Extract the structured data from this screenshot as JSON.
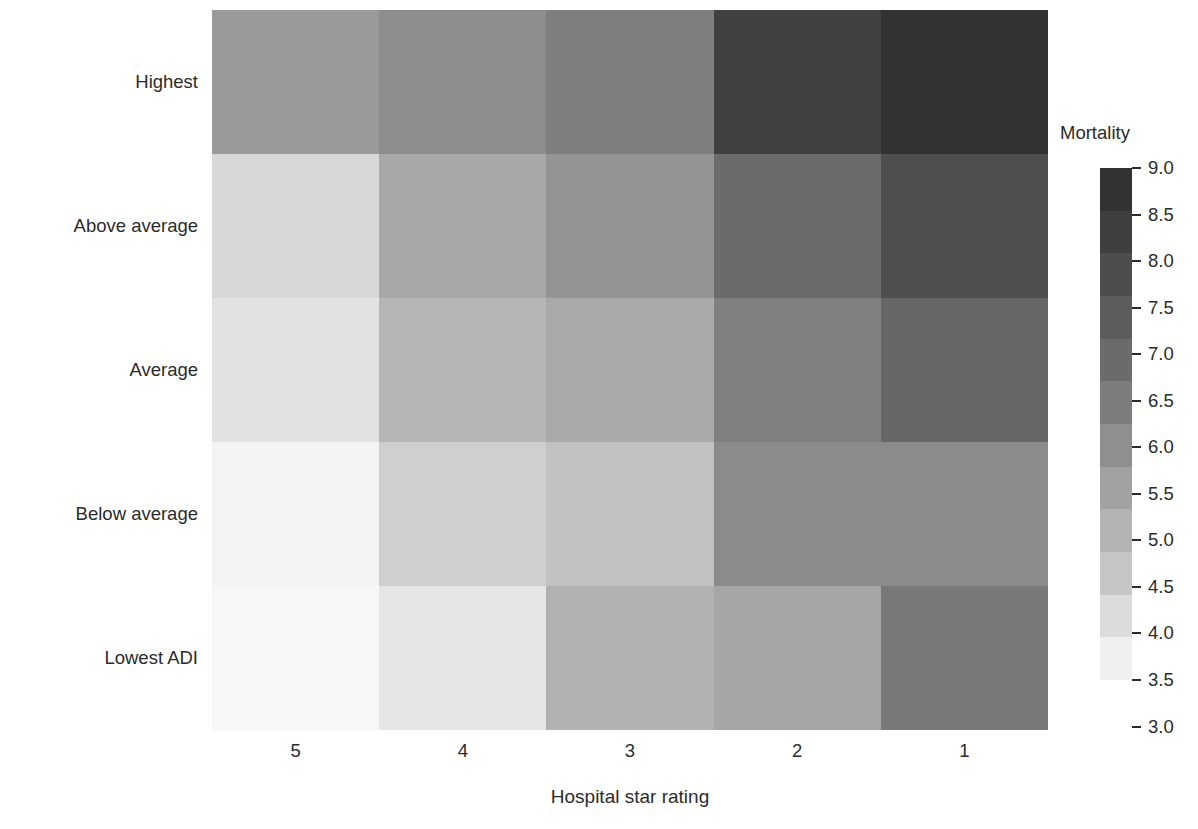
{
  "chart_data": {
    "type": "heatmap",
    "title": "",
    "xlabel": "Hospital star rating",
    "ylabel": "Neighborhood deprivation",
    "x_categories": [
      "5",
      "4",
      "3",
      "2",
      "1"
    ],
    "y_categories": [
      "Highest",
      "Above average",
      "Average",
      "Below average",
      "Lowest ADI"
    ],
    "colorbar": {
      "label": "Mortality",
      "ticks": [
        "9.0",
        "8.5",
        "8.0",
        "7.5",
        "7.0",
        "6.5",
        "6.0",
        "5.5",
        "5.0",
        "4.5",
        "4.0",
        "3.5",
        "3.0"
      ],
      "vmin": 3.0,
      "vmax": 9.0,
      "discrete_bands": 12,
      "band_colors": [
        "#333333",
        "#3f3f3f",
        "#4d4d4d",
        "#5c5c5c",
        "#6b6b6b",
        "#7d7d7d",
        "#8f8f8f",
        "#a2a2a2",
        "#b4b4b4",
        "#c6c6c6",
        "#dcdcdc",
        "#f0f0f0"
      ]
    },
    "grid": false,
    "legend_position": "right",
    "rows": [
      {
        "label": "Highest",
        "values": [
          6.6,
          7.0,
          7.3,
          8.6,
          8.9
        ],
        "colors": [
          "#9a9a9a",
          "#8d8d8d",
          "#7f7f7f",
          "#414141",
          "#333333"
        ]
      },
      {
        "label": "Above average",
        "values": [
          4.6,
          6.2,
          6.9,
          7.8,
          8.3
        ],
        "colors": [
          "#d8d8d8",
          "#a8a8a8",
          "#949494",
          "#6b6b6b",
          "#4e4e4e"
        ]
      },
      {
        "label": "Average",
        "values": [
          4.4,
          5.8,
          6.3,
          7.3,
          7.9
        ],
        "colors": [
          "#e2e2e2",
          "#b6b6b6",
          "#aaaaaa",
          "#808080",
          "#666666"
        ]
      },
      {
        "label": "Below average",
        "values": [
          3.9,
          5.1,
          5.5,
          6.9,
          6.9
        ],
        "colors": [
          "#f3f3f3",
          "#cfcfcf",
          "#c2c2c2",
          "#8b8b8b",
          "#8b8b8b"
        ]
      },
      {
        "label": "Lowest ADI",
        "values": [
          3.8,
          4.3,
          5.9,
          6.3,
          7.3
        ]
      }
    ],
    "row5_colors": [
      "#f7f7f7",
      "#e6e6e6",
      "#b2b2b2",
      "#a6a6a6",
      "#787878"
    ]
  },
  "colors": {
    "background": "#ffffff",
    "text": "#2b2b2b"
  }
}
